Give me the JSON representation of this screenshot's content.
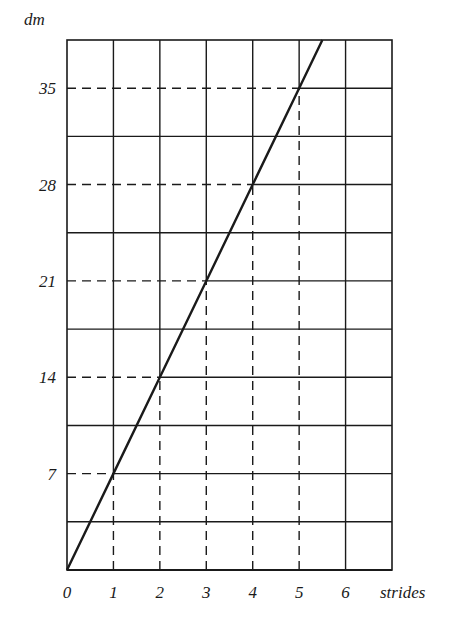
{
  "chart_data": {
    "type": "line",
    "title": "",
    "xlabel": "strides",
    "ylabel": "dm",
    "x_ticks": [
      "0",
      "1",
      "2",
      "3",
      "4",
      "5",
      "6"
    ],
    "y_ticks": [
      "7",
      "14",
      "21",
      "28",
      "35"
    ],
    "xlim": [
      0,
      7
    ],
    "ylim": [
      0,
      38.5
    ],
    "grid": true,
    "grid_rows": 11,
    "grid_cols": 7,
    "series": [
      {
        "name": "distance",
        "x": [
          0,
          1,
          2,
          3,
          4,
          5,
          5.5
        ],
        "y": [
          0,
          7,
          14,
          21,
          28,
          35,
          38.5
        ]
      }
    ],
    "annotations": [
      {
        "type": "dashed-guide",
        "x": 1,
        "y": 7
      },
      {
        "type": "dashed-guide",
        "x": 2,
        "y": 14
      },
      {
        "type": "dashed-guide",
        "x": 3,
        "y": 21
      },
      {
        "type": "dashed-guide",
        "x": 4,
        "y": 28
      },
      {
        "type": "dashed-guide",
        "x": 5,
        "y": 35
      }
    ]
  },
  "colors": {
    "ink": "#1a1a1a",
    "background": "#ffffff"
  }
}
